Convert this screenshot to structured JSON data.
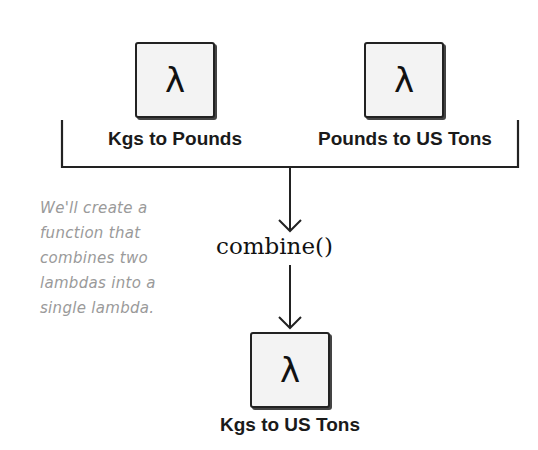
{
  "diagram": {
    "inputs": [
      {
        "symbol": "λ",
        "label": "Kgs to Pounds"
      },
      {
        "symbol": "λ",
        "label": "Pounds to US Tons"
      }
    ],
    "function": {
      "label": "combine()"
    },
    "output": {
      "symbol": "λ",
      "label": "Kgs to US Tons"
    },
    "annotation": {
      "lines": [
        "We'll create a",
        "function that",
        "combines two",
        "lambdas into a",
        "single lambda."
      ]
    },
    "colors": {
      "stroke": "#222222",
      "box_fill": "#f3f3f3",
      "annotation_text": "#9a9a9a"
    }
  }
}
